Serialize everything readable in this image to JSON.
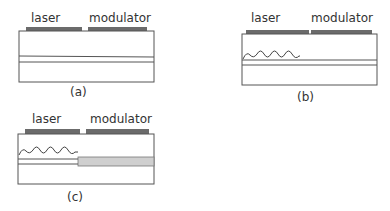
{
  "figure": {
    "panels": [
      {
        "id": "a",
        "caption": "(a)",
        "contact_labels": {
          "laser": "laser",
          "modulator": "modulator"
        },
        "has_grating": false,
        "has_modulator_waveguide": false
      },
      {
        "id": "b",
        "caption": "(b)",
        "contact_labels": {
          "laser": "laser",
          "modulator": "modulator"
        },
        "has_grating": true,
        "has_modulator_waveguide": false
      },
      {
        "id": "c",
        "caption": "(c)",
        "contact_labels": {
          "laser": "laser",
          "modulator": "modulator"
        },
        "has_grating": true,
        "has_modulator_waveguide": true
      }
    ],
    "colors": {
      "outline": "#555555",
      "contact": "#6b6b6b",
      "waveguide_gray": "#cfcfcf",
      "text": "#333333"
    }
  }
}
